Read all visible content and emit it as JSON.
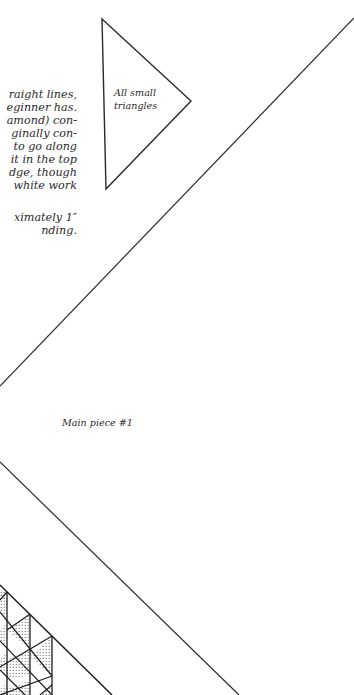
{
  "page": {
    "background": "#ffffff",
    "ink_color": "#2a2a2a"
  },
  "body_text": {
    "paragraph1_lines": [
      "raight lines,",
      "eginner has.",
      "amond) con-",
      "ginally con-",
      "to go along",
      "it in the top",
      "dge, though",
      "white work"
    ],
    "paragraph2_lines": [
      "ximately 1″",
      "nding."
    ]
  },
  "labels": {
    "triangle_label_line1": "All small",
    "triangle_label_line2": "triangles",
    "main_piece_label": "Main piece #1"
  },
  "shapes": {
    "small_triangle": {
      "vertices": [
        [
          102,
          19
        ],
        [
          191,
          101
        ],
        [
          106,
          189
        ]
      ]
    },
    "upper_diagonal": {
      "from": [
        354,
        18
      ],
      "to": [
        0,
        386
      ]
    },
    "lower_diagonal": {
      "from": [
        0,
        462
      ],
      "to": [
        239,
        695
      ]
    },
    "triangle_grid": {
      "hypotenuse": {
        "from": [
          0,
          585
        ],
        "to": [
          112,
          695
        ]
      },
      "vertical_lines_x": [
        7,
        30,
        52
      ],
      "fill_pattern": "dotted"
    }
  }
}
